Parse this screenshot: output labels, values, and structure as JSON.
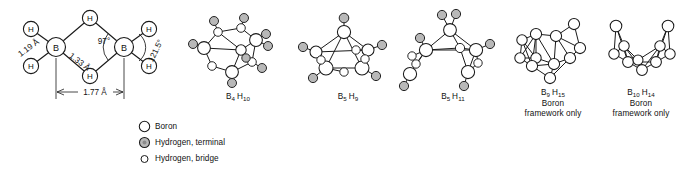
{
  "figure": {
    "background": "#ffffff",
    "line_color": "#1a1a1a",
    "atom_fill_boron": "#ffffff",
    "atom_fill_h_terminal": "#b8b8b8",
    "atom_fill_h_bridge": "#ffffff"
  },
  "diborane": {
    "atom_labels": {
      "boron_left": "B",
      "boron_right": "B",
      "h_top_bridge": "H",
      "h_bottom_bridge": "H",
      "h_left_upper": "H",
      "h_left_lower": "H",
      "h_right_upper": "H",
      "h_right_lower": "H"
    },
    "measurements": {
      "terminal_bond": "1.19 Å",
      "bridge_bond": "1.33 Å",
      "bridge_angle": "97°",
      "terminal_angle": "121.5°",
      "boron_boron": "1.77 Å"
    }
  },
  "structures": [
    {
      "name": "b4h10",
      "formula_b": "B",
      "formula_b_sub": "4",
      "formula_h": "H",
      "formula_h_sub": "10",
      "note": ""
    },
    {
      "name": "b5h9",
      "formula_b": "B",
      "formula_b_sub": "5",
      "formula_h": "H",
      "formula_h_sub": "9",
      "note": ""
    },
    {
      "name": "b5h11",
      "formula_b": "B",
      "formula_b_sub": "5",
      "formula_h": "H",
      "formula_h_sub": "11",
      "note": ""
    },
    {
      "name": "b9h15",
      "formula_b": "B",
      "formula_b_sub": "9",
      "formula_h": "H",
      "formula_h_sub": "15",
      "note": "Boron",
      "note2": "framework only"
    },
    {
      "name": "b10h14",
      "formula_b": "B",
      "formula_b_sub": "10",
      "formula_h": "H",
      "formula_h_sub": "14",
      "note": "Boron",
      "note2": "framework only"
    }
  ],
  "legend": {
    "items": [
      {
        "icon": "circle-open-large",
        "label": "Boron"
      },
      {
        "icon": "circle-shaded",
        "label": "Hydrogen, terminal"
      },
      {
        "icon": "circle-open-small",
        "label": "Hydrogen, bridge"
      }
    ]
  }
}
